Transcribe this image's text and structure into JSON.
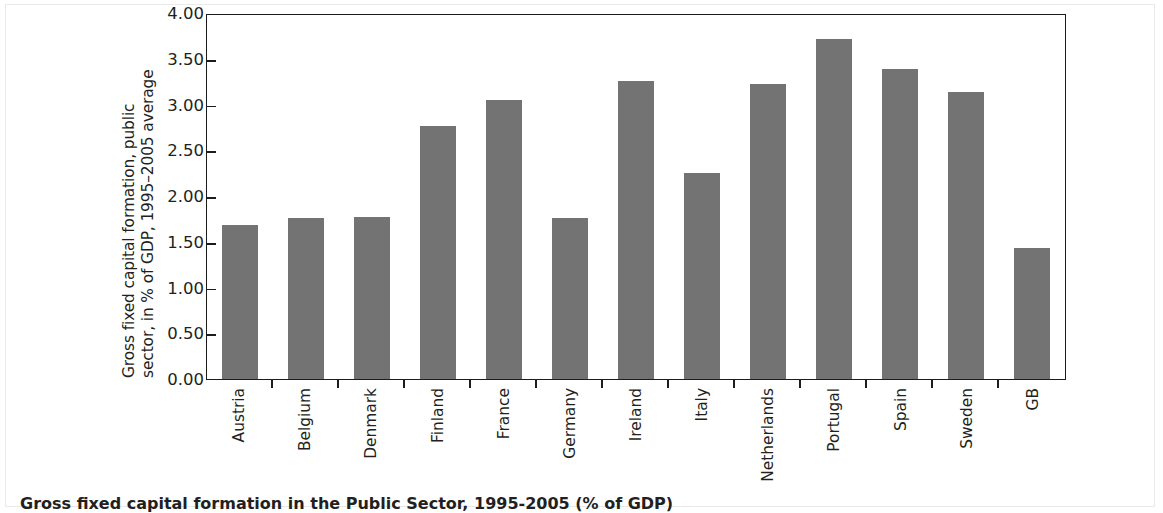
{
  "chart_data": {
    "type": "bar",
    "title": "Gross fixed capital formation in the Public Sector, 1995-2005 (% of GDP)",
    "xlabel": "",
    "ylabel": "Gross fixed capital formation, public sector, in % of GDP, 1995–2005 average",
    "ylabel_lines": [
      "Gross fixed capital formation, public",
      "sector, in % of GDP, 1995–2005 average"
    ],
    "categories": [
      "Austria",
      "Belgium",
      "Denmark",
      "Finland",
      "France",
      "Germany",
      "Ireland",
      "Italy",
      "Netherlands",
      "Portugal",
      "Spain",
      "Sweden",
      "GB"
    ],
    "values": [
      1.68,
      1.76,
      1.77,
      2.76,
      3.05,
      1.76,
      3.26,
      2.25,
      3.22,
      3.72,
      3.39,
      3.14,
      1.43
    ],
    "ylim": [
      0.0,
      4.0
    ],
    "ytick_values": [
      4.0,
      3.5,
      3.0,
      2.5,
      2.0,
      1.5,
      1.0,
      0.5,
      0.0
    ],
    "ytick_labels": [
      "4.00",
      "3.50",
      "3.00",
      "2.50",
      "2.00",
      "1.50",
      "1.00",
      "0.50",
      "0.00"
    ],
    "grid": false,
    "legend": null,
    "bar_color": "#737373",
    "axis_color": "#1c1c1c",
    "background": "#ffffff"
  },
  "caption": {
    "text": "Gross fixed capital formation in the Public Sector, 1995-2005 (% of GDP)"
  }
}
